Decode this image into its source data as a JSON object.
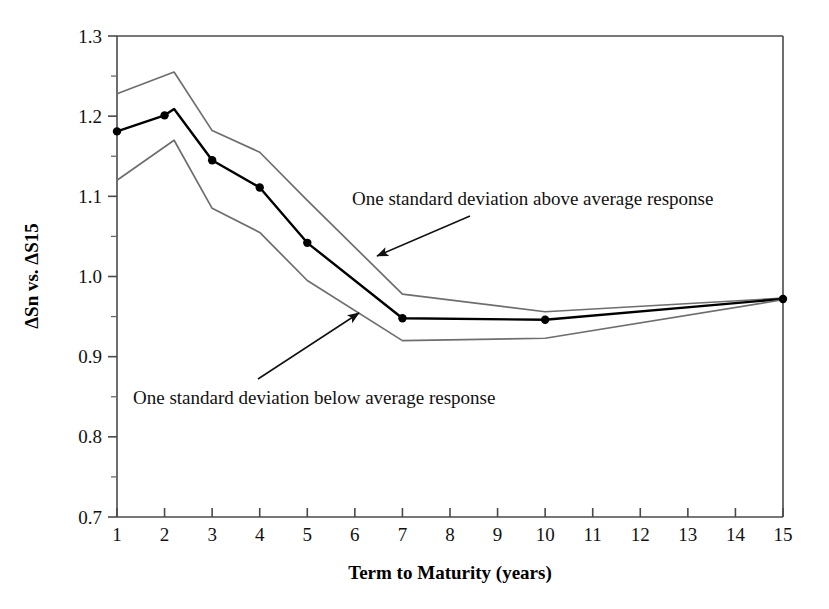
{
  "chart_data": {
    "type": "line",
    "title": "",
    "xlabel": "Term to Maturity (years)",
    "ylabel": "ΔSn vs. ΔS15",
    "xlim": [
      1,
      15
    ],
    "ylim": [
      0.7,
      1.3
    ],
    "grid": false,
    "legend_position": "none",
    "x_tick_labels": [
      "1",
      "2",
      "3",
      "4",
      "5",
      "6",
      "7",
      "8",
      "9",
      "10",
      "11",
      "12",
      "13",
      "14",
      "15"
    ],
    "x_ticks": [
      1,
      2,
      3,
      4,
      5,
      6,
      7,
      8,
      9,
      10,
      11,
      12,
      13,
      14,
      15
    ],
    "y_tick_labels": [
      "0.7",
      "0.8",
      "0.9",
      "1.0",
      "1.1",
      "1.2",
      "1.3"
    ],
    "y_ticks": [
      0.7,
      0.8,
      0.9,
      1.0,
      1.1,
      1.2,
      1.3
    ],
    "y_minor_ticks": [
      0.75,
      0.85,
      0.95,
      1.05,
      1.15,
      1.25
    ],
    "series": [
      {
        "name": "One standard deviation above average response",
        "color": "#6e6e6e",
        "marker": "none",
        "x": [
          1,
          2.2,
          3,
          4,
          5,
          7,
          10,
          15
        ],
        "values": [
          1.228,
          1.255,
          1.182,
          1.155,
          1.095,
          0.978,
          0.956,
          0.973
        ]
      },
      {
        "name": "Average response",
        "color": "#000000",
        "marker": "filled-circle",
        "x": [
          1,
          2,
          2.2,
          3,
          4,
          5,
          7,
          10,
          15
        ],
        "values": [
          1.181,
          1.201,
          1.209,
          1.145,
          1.111,
          1.042,
          0.948,
          0.946,
          0.972
        ]
      },
      {
        "name": "One standard deviation below average response",
        "color": "#6e6e6e",
        "marker": "none",
        "x": [
          1,
          2.2,
          3,
          4,
          5,
          7,
          10,
          15
        ],
        "values": [
          1.12,
          1.17,
          1.085,
          1.055,
          0.995,
          0.92,
          0.923,
          0.971
        ]
      }
    ],
    "annotations": [
      {
        "id": "upper-band-annotation",
        "text": "One standard deviation above average response",
        "text_x": 352,
        "text_y": 205,
        "arrow_from_x": 470,
        "arrow_from_y": 216,
        "arrow_to_x": 377,
        "arrow_to_y": 256
      },
      {
        "id": "lower-band-annotation",
        "text": "One standard deviation below average response",
        "text_x": 133,
        "text_y": 404,
        "arrow_from_x": 258,
        "arrow_from_y": 379,
        "arrow_to_x": 359,
        "arrow_to_y": 313
      }
    ]
  },
  "colors": {
    "band_line": "#6e6e6e",
    "mean_line": "#000000",
    "axis": "#4a4a4a",
    "background": "#ffffff"
  }
}
